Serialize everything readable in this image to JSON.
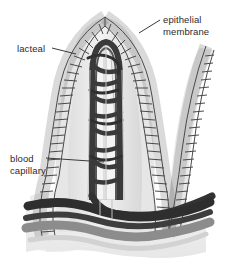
{
  "figure": {
    "background_color": "#ffffff",
    "ink_color": "#2b2b2b"
  },
  "labels": {
    "epithelial": {
      "line1": "epithelial",
      "line2": "membrane"
    },
    "lacteal": {
      "text": "lacteal"
    },
    "blood_capillary": {
      "line1": "blood",
      "line2": "capillary"
    }
  },
  "leaders": [
    {
      "name": "epithelial-leader",
      "x1": 160,
      "y1": 20,
      "x2": 139,
      "y2": 33
    },
    {
      "name": "lacteal-leader",
      "x1": 52,
      "y1": 48,
      "x2": 76,
      "y2": 54
    },
    {
      "name": "blood-capillary-leader",
      "x1": 46,
      "y1": 158,
      "x2": 104,
      "y2": 162
    }
  ],
  "palette": {
    "vessel_dark": "#3a3a3a",
    "vessel_mid": "#6e6e6e",
    "tissue_light": "#e2e2e2",
    "tissue_pale": "#efefef",
    "lacteal_fill": "#f2f2f2",
    "cell_fill": "#dcdcdc",
    "cell_stroke": "#4a4a4a",
    "base_band": "#8c8c8c"
  },
  "structures": [
    {
      "name": "villus-body",
      "description": "tall finger-like projection, tip near x=105 y=18"
    },
    {
      "name": "epithelial-cell-border",
      "description": "chain of oval cells lining villus outline"
    },
    {
      "name": "central-lacteal",
      "description": "pale vertical lymph vessel in villus core"
    },
    {
      "name": "capillary-network",
      "description": "dark looping vessels around lacteal"
    },
    {
      "name": "adjacent-villus-right",
      "description": "partial villus at right forming valley"
    },
    {
      "name": "submucosa-vessels",
      "description": "horizontal dark bands at base"
    }
  ]
}
